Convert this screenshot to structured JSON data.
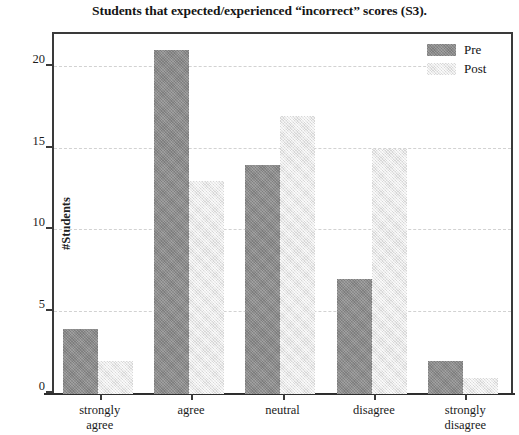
{
  "chart_data": {
    "type": "bar",
    "title": "Students that expected/experienced “incorrect” scores (S3).",
    "xlabel": "",
    "ylabel": "#Students",
    "categories": [
      "strongly agree",
      "agree",
      "neutral",
      "disagree",
      "strongly disagree"
    ],
    "category_lines": [
      [
        "strongly",
        "agree"
      ],
      [
        "agree"
      ],
      [
        "neutral"
      ],
      [
        "disagree"
      ],
      [
        "strongly",
        "disagree"
      ]
    ],
    "series": [
      {
        "name": "Pre",
        "values": [
          4,
          21,
          14,
          7,
          2
        ],
        "color": "#8d8d8d"
      },
      {
        "name": "Post",
        "values": [
          2,
          13,
          17,
          15,
          1
        ],
        "color": "#ebebeb"
      }
    ],
    "ylim": [
      0,
      22
    ],
    "yticks": [
      0,
      5,
      10,
      15,
      20
    ],
    "ytick_labels": [
      "0",
      "5",
      "10",
      "15",
      "20"
    ],
    "grid": "horizontal-dashed",
    "legend_position": "top-right",
    "legend_entries": [
      "Pre",
      "Post"
    ]
  }
}
